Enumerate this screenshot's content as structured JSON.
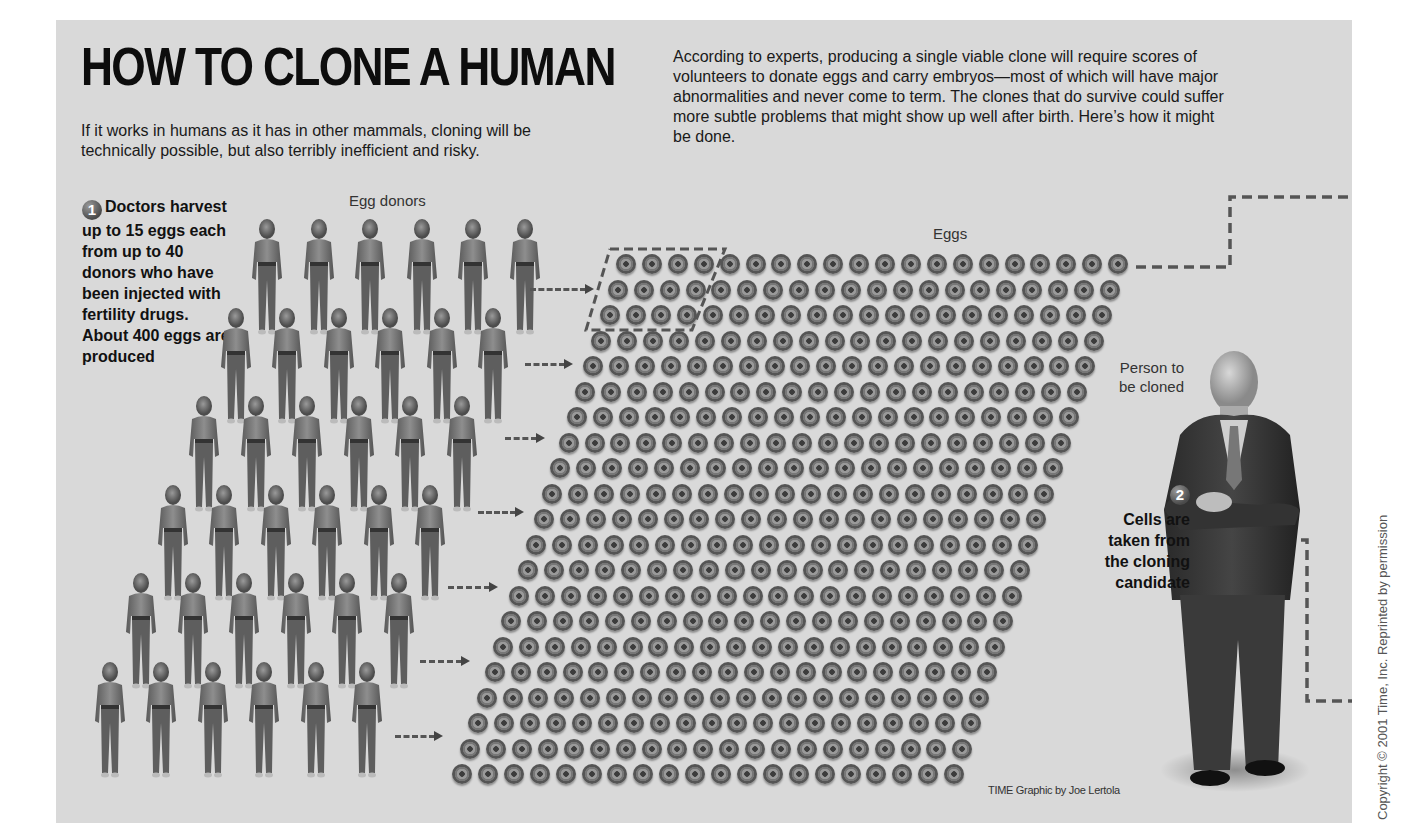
{
  "header": {
    "title": "HOW TO CLONE A HUMAN",
    "subtitle": "If it works in humans as it has in other mammals, cloning will be technically possible, but also terribly inefficient and risky.",
    "intro": "According to experts, producing a single viable clone will require scores of volunteers to donate eggs and carry embryos—most of which will have major abnormalities and never come to term. The clones that do survive could suffer more subtle problems that might show up well after birth. Here’s how it might be done."
  },
  "steps": [
    {
      "number": "1",
      "lead": "Doctors",
      "text": "harvest up to 15 eggs each from up to 40 donors who have been injected with fertility drugs. About 400 eggs are produced"
    },
    {
      "number": "2",
      "text": "Cells are taken from the cloning candidate"
    }
  ],
  "labels": {
    "egg_donors": "Egg donors",
    "eggs": "Eggs",
    "person_to_be_cloned": "Person to be cloned"
  },
  "illustration": {
    "donor_rows": 6,
    "donors_per_row": 6,
    "egg_rows": 21,
    "eggs_per_row": 20,
    "donor_icon": "person-figure-icon",
    "egg_icon": "egg-cell-icon",
    "arrow_icon": "dashed-arrow-icon",
    "highlighted_eggs": "group of ~12 eggs outlined by dashed line (one donor's harvest)"
  },
  "footer": {
    "credit": "TIME Graphic by Joe Lertola",
    "copyright": "Copyright © 2001 Time, Inc. Reprinted by permission"
  },
  "colors": {
    "panel_background": "#d9d9d9",
    "page_background": "#ffffff",
    "text": "#161616",
    "dashed_line": "#555555"
  }
}
